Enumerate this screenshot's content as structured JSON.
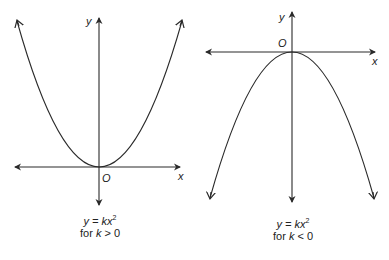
{
  "graphs": [
    {
      "id": "positive-k",
      "axis_labels": {
        "x": "x",
        "y": "y",
        "origin": "O"
      },
      "caption": {
        "line1_prefix": "y = kx",
        "exponent": "2",
        "line2_prefix": "for ",
        "var": "k",
        "condition": " > 0"
      },
      "shape": "upward-opening parabola"
    },
    {
      "id": "negative-k",
      "axis_labels": {
        "x": "x",
        "y": "y",
        "origin": "O"
      },
      "caption": {
        "line1_prefix": "y = kx",
        "exponent": "2",
        "line2_prefix": "for ",
        "var": "k",
        "condition": " < 0"
      },
      "shape": "downward-opening parabola"
    }
  ],
  "colors": {
    "line": "#2a2a2a",
    "background": "#ffffff"
  }
}
